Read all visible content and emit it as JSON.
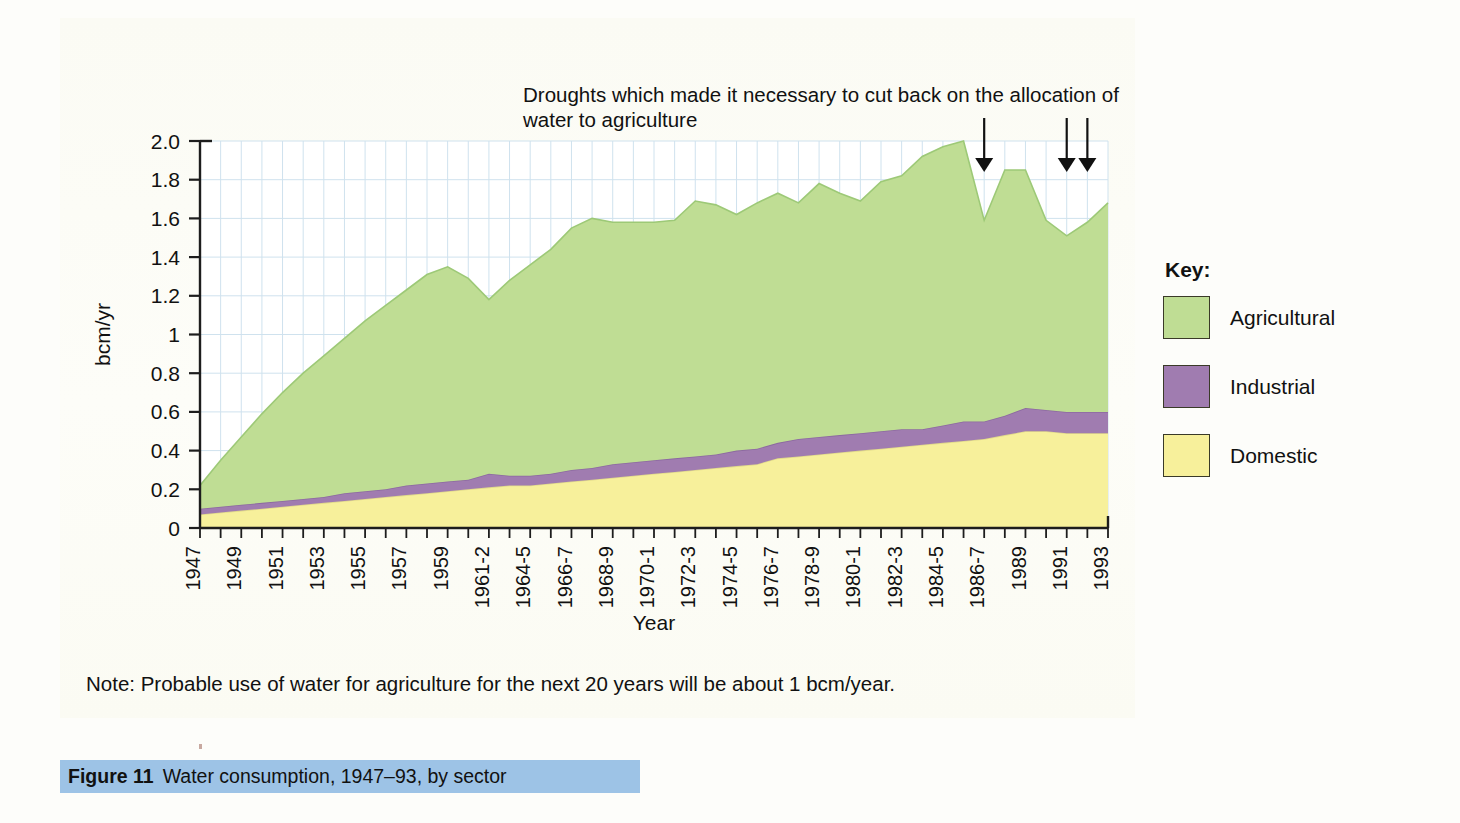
{
  "annotation": {
    "text": "Droughts which made it necessary to cut back on the allocation of water to agriculture",
    "arrow_count": 3
  },
  "axes": {
    "y_label": "bcm/yr",
    "x_label": "Year",
    "y_ticks": [
      "0",
      "0.2",
      "0.4",
      "0.6",
      "0.8",
      "1",
      "1.2",
      "1.4",
      "1.6",
      "1.8",
      "2.0"
    ]
  },
  "key": {
    "title": "Key:",
    "items": [
      {
        "label": "Agricultural",
        "color": "#bfdd94"
      },
      {
        "label": "Industrial",
        "color": "#a07cb0"
      },
      {
        "label": "Domestic",
        "color": "#f7f09b"
      }
    ]
  },
  "note": "Note: Probable use of water for agriculture for the next 20 years will be about 1 bcm/year.",
  "caption": {
    "number": "Figure 11",
    "text": "Water consumption, 1947–93, by sector",
    "highlight_color": "#9dc3e6"
  },
  "chart_data": {
    "type": "area",
    "title": "Water consumption, 1947–93, by sector",
    "xlabel": "Year",
    "ylabel": "bcm/yr",
    "ylim": [
      0,
      2.0
    ],
    "grid": true,
    "legend_position": "right",
    "stacked": true,
    "categories": [
      "1947",
      "1948",
      "1949",
      "1950",
      "1951",
      "1952",
      "1953",
      "1954",
      "1955",
      "1956",
      "1957",
      "1958",
      "1959",
      "1960",
      "1961-2",
      "1963",
      "1964-5",
      "1965",
      "1966-7",
      "1967",
      "1968-9",
      "1969",
      "1970-1",
      "1971",
      "1972-3",
      "1973",
      "1974-5",
      "1975",
      "1976-7",
      "1977",
      "1978-9",
      "1979",
      "1980-1",
      "1981",
      "1982-3",
      "1983",
      "1984-5",
      "1985",
      "1986-7",
      "1988",
      "1989",
      "1990",
      "1991",
      "1992",
      "1993"
    ],
    "tick_labels": [
      "1947",
      "1949",
      "1951",
      "1953",
      "1955",
      "1957",
      "1959",
      "1961-2",
      "1964-5",
      "1966-7",
      "1968-9",
      "1970-1",
      "1972-3",
      "1974-5",
      "1976-7",
      "1978-9",
      "1980-1",
      "1982-3",
      "1984-5",
      "1986-7",
      "1989",
      "1991",
      "1993"
    ],
    "series": [
      {
        "name": "Domestic",
        "color": "#f7f09b",
        "values": [
          0.07,
          0.08,
          0.09,
          0.1,
          0.11,
          0.12,
          0.13,
          0.14,
          0.15,
          0.16,
          0.17,
          0.18,
          0.19,
          0.2,
          0.21,
          0.22,
          0.22,
          0.23,
          0.24,
          0.25,
          0.26,
          0.27,
          0.28,
          0.29,
          0.3,
          0.31,
          0.32,
          0.33,
          0.36,
          0.37,
          0.38,
          0.39,
          0.4,
          0.41,
          0.42,
          0.43,
          0.44,
          0.45,
          0.46,
          0.48,
          0.5,
          0.5,
          0.49,
          0.49,
          0.49
        ]
      },
      {
        "name": "Industrial",
        "color": "#a07cb0",
        "values": [
          0.03,
          0.03,
          0.03,
          0.03,
          0.03,
          0.03,
          0.03,
          0.04,
          0.04,
          0.04,
          0.05,
          0.05,
          0.05,
          0.05,
          0.07,
          0.05,
          0.05,
          0.05,
          0.06,
          0.06,
          0.07,
          0.07,
          0.07,
          0.07,
          0.07,
          0.07,
          0.08,
          0.08,
          0.08,
          0.09,
          0.09,
          0.09,
          0.09,
          0.09,
          0.09,
          0.08,
          0.09,
          0.1,
          0.09,
          0.1,
          0.12,
          0.11,
          0.11,
          0.11,
          0.11
        ]
      },
      {
        "name": "Agricultural",
        "color": "#bfdd94",
        "values": [
          0.12,
          0.24,
          0.35,
          0.46,
          0.56,
          0.65,
          0.73,
          0.8,
          0.88,
          0.95,
          1.01,
          1.08,
          1.11,
          1.04,
          0.9,
          1.01,
          1.09,
          1.16,
          1.25,
          1.29,
          1.25,
          1.24,
          1.23,
          1.23,
          1.32,
          1.29,
          1.22,
          1.27,
          1.29,
          1.22,
          1.31,
          1.25,
          1.2,
          1.29,
          1.31,
          1.41,
          1.44,
          1.45,
          1.04,
          1.27,
          1.23,
          0.98,
          0.91,
          0.98,
          1.08
        ]
      }
    ],
    "stack_totals": [
      0.22,
      0.35,
      0.47,
      0.59,
      0.7,
      0.8,
      0.89,
      0.98,
      1.07,
      1.15,
      1.23,
      1.31,
      1.35,
      1.29,
      1.18,
      1.28,
      1.36,
      1.44,
      1.55,
      1.6,
      1.58,
      1.58,
      1.58,
      1.59,
      1.69,
      1.67,
      1.62,
      1.68,
      1.73,
      1.68,
      1.78,
      1.73,
      1.69,
      1.79,
      1.82,
      1.92,
      1.97,
      2.0,
      1.59,
      1.85,
      1.85,
      1.59,
      1.51,
      1.58,
      1.68
    ],
    "annotations": [
      {
        "text": "Droughts which made it necessary to cut back on the allocation of water to agriculture",
        "arrows_at": [
          "1986-7",
          "1991",
          "1992"
        ]
      }
    ]
  }
}
